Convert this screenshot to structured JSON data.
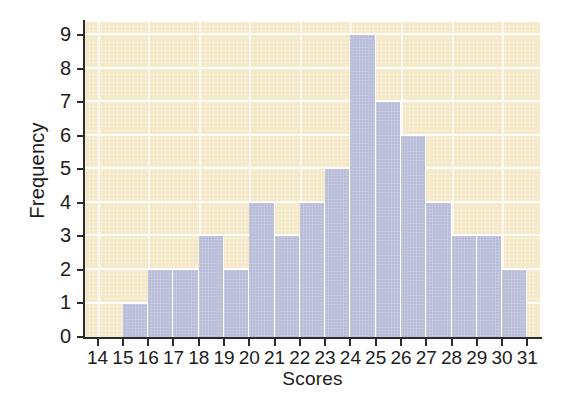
{
  "chart_data": {
    "type": "bar",
    "title": "",
    "subtitle": "",
    "xlabel": "Scores",
    "ylabel": "Frequency",
    "categories": [
      14,
      15,
      16,
      17,
      18,
      19,
      20,
      21,
      22,
      23,
      24,
      25,
      26,
      27,
      28,
      29,
      30,
      31
    ],
    "values": [
      0,
      1,
      2,
      2,
      3,
      2,
      4,
      3,
      4,
      5,
      9,
      7,
      6,
      4,
      3,
      3,
      2,
      0
    ],
    "xtick_labels": [
      "14",
      "15",
      "16",
      "17",
      "18",
      "19",
      "20",
      "21",
      "22",
      "23",
      "24",
      "25",
      "26",
      "27",
      "28",
      "29",
      "30",
      "31"
    ],
    "ytick_labels": [
      "0",
      "1",
      "2",
      "3",
      "4",
      "5",
      "6",
      "7",
      "8",
      "9"
    ],
    "ytick_values": [
      0,
      1,
      2,
      3,
      4,
      5,
      6,
      7,
      8,
      9
    ],
    "ylim": [
      0,
      9.4
    ],
    "xlim": [
      13.5,
      31.5
    ],
    "grid": true,
    "grid_color": "#ffffff",
    "legend": null,
    "legend_position": "none",
    "bar_color": "#b7bcd8",
    "bar_edge_color": "#ffffff",
    "plot_background": "#f4e7c6",
    "axis_color": "#2b2b2b",
    "text_color": "#1c1c1c",
    "annotations": [],
    "bins": [
      {
        "score": "14",
        "frequency": 0
      },
      {
        "score": "15",
        "frequency": 1
      },
      {
        "score": "16",
        "frequency": 2
      },
      {
        "score": "17",
        "frequency": 2
      },
      {
        "score": "18",
        "frequency": 3
      },
      {
        "score": "19",
        "frequency": 2
      },
      {
        "score": "20",
        "frequency": 4
      },
      {
        "score": "21",
        "frequency": 3
      },
      {
        "score": "22",
        "frequency": 4
      },
      {
        "score": "23",
        "frequency": 5
      },
      {
        "score": "24",
        "frequency": 9
      },
      {
        "score": "25",
        "frequency": 7
      },
      {
        "score": "26",
        "frequency": 6
      },
      {
        "score": "27",
        "frequency": 4
      },
      {
        "score": "28",
        "frequency": 3
      },
      {
        "score": "29",
        "frequency": 3
      },
      {
        "score": "30",
        "frequency": 2
      },
      {
        "score": "31",
        "frequency": 0
      }
    ]
  }
}
